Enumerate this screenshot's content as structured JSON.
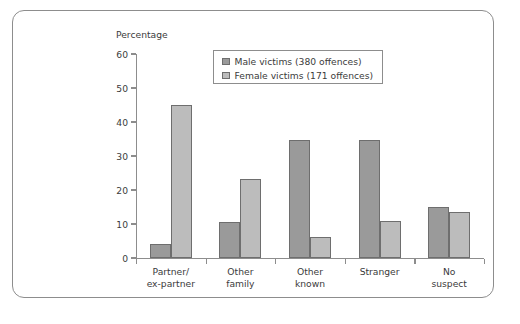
{
  "figure": {
    "frame": true,
    "background_color": "#ffffff",
    "border_color": "#8d8d8d"
  },
  "chart_data": {
    "type": "bar",
    "title": "",
    "subtitle": "",
    "xlabel": "",
    "ylabel": "Percentage",
    "categories": [
      "Partner/ ex-partner",
      "Other family",
      "Other known",
      "Stranger",
      "No suspect"
    ],
    "category_lines": [
      [
        "Partner/",
        "ex-partner"
      ],
      [
        "Other",
        "family"
      ],
      [
        "Other",
        "known"
      ],
      [
        "Stranger",
        ""
      ],
      [
        "No",
        "suspect"
      ]
    ],
    "series": [
      {
        "name": "Male victims (380 offences)",
        "color": "#9a9a9a",
        "values": [
          4,
          10.5,
          34.7,
          34.7,
          15
        ]
      },
      {
        "name": "Female victims (171 offences)",
        "color": "#bcbcbc",
        "values": [
          45,
          23.2,
          6.3,
          10.8,
          13.4
        ]
      }
    ],
    "ylim": [
      0,
      60
    ],
    "yticks": [
      0,
      10,
      20,
      30,
      40,
      50,
      60
    ],
    "ytick_labels": [
      "0",
      "10",
      "20",
      "30",
      "40",
      "50",
      "60"
    ],
    "grid": false,
    "legend_position": "top-center"
  },
  "legend": {
    "entries": [
      {
        "label": "Male victims (380 offences)",
        "swatch": "male"
      },
      {
        "label": "Female victims (171 offences)",
        "swatch": "female"
      }
    ]
  }
}
